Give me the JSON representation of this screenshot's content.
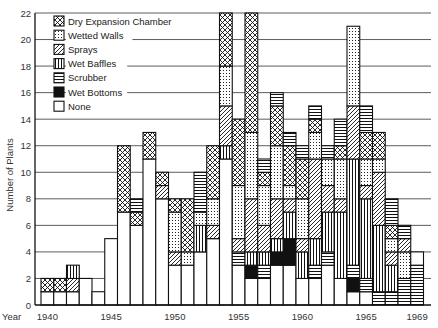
{
  "chart_data": {
    "type": "bar",
    "stacked": true,
    "title": "",
    "xlabel": "Year",
    "ylabel": "Number of Plants",
    "ylim": [
      0,
      22
    ],
    "yticks": [
      0,
      2,
      4,
      6,
      8,
      10,
      12,
      14,
      16,
      18,
      20,
      22
    ],
    "x_tick_labels": [
      {
        "year": 1940,
        "label": "1940"
      },
      {
        "year": 1945,
        "label": "1945"
      },
      {
        "year": 1950,
        "label": "1950"
      },
      {
        "year": 1955,
        "label": "1955"
      },
      {
        "year": 1960,
        "label": "1960"
      },
      {
        "year": 1965,
        "label": "1965"
      },
      {
        "year": 1969,
        "label": "1969"
      }
    ],
    "grid": true,
    "legend_position": "top-left",
    "legend": [
      {
        "key": "dry",
        "label": "Dry Expansion Chamber",
        "pattern": "crosshatch-circles"
      },
      {
        "key": "wetted",
        "label": "Wetted Walls",
        "pattern": "dots"
      },
      {
        "key": "sprays",
        "label": "Sprays",
        "pattern": "diagonal"
      },
      {
        "key": "baffles",
        "label": "Wet Baffles",
        "pattern": "vertical"
      },
      {
        "key": "scrubber",
        "label": "Scrubber",
        "pattern": "horizontal"
      },
      {
        "key": "bottoms",
        "label": "Wet Bottoms",
        "pattern": "solid"
      },
      {
        "key": "none",
        "label": "None",
        "pattern": "empty"
      }
    ],
    "bars": [
      {
        "year": 1940,
        "segments": [
          [
            "none",
            1
          ],
          [
            "dry",
            1
          ]
        ]
      },
      {
        "year": 1941,
        "segments": [
          [
            "none",
            1
          ],
          [
            "dry",
            1
          ]
        ]
      },
      {
        "year": 1942,
        "segments": [
          [
            "none",
            1
          ],
          [
            "sprays",
            1
          ],
          [
            "baffles",
            1
          ]
        ]
      },
      {
        "year": 1943,
        "segments": [
          [
            "none",
            2
          ]
        ]
      },
      {
        "year": 1944,
        "segments": [
          [
            "none",
            1
          ]
        ]
      },
      {
        "year": 1945,
        "segments": [
          [
            "none",
            5
          ]
        ]
      },
      {
        "year": 1946,
        "segments": [
          [
            "none",
            7
          ],
          [
            "dry",
            5
          ]
        ]
      },
      {
        "year": 1947,
        "segments": [
          [
            "none",
            6
          ],
          [
            "dry",
            1
          ],
          [
            "scrubber",
            1
          ]
        ]
      },
      {
        "year": 1948,
        "segments": [
          [
            "none",
            11
          ],
          [
            "dry",
            2
          ]
        ]
      },
      {
        "year": 1949,
        "segments": [
          [
            "none",
            8
          ],
          [
            "sprays",
            1
          ],
          [
            "dry",
            1
          ]
        ]
      },
      {
        "year": 1950,
        "segments": [
          [
            "none",
            3
          ],
          [
            "sprays",
            1
          ],
          [
            "wetted",
            3
          ],
          [
            "dry",
            1
          ]
        ]
      },
      {
        "year": 1951,
        "segments": [
          [
            "none",
            3
          ],
          [
            "wetted",
            1
          ],
          [
            "dry",
            4
          ]
        ]
      },
      {
        "year": 1952,
        "segments": [
          [
            "none",
            4
          ],
          [
            "baffles",
            2
          ],
          [
            "wetted",
            1
          ],
          [
            "scrubber",
            3
          ]
        ]
      },
      {
        "year": 1953,
        "segments": [
          [
            "none",
            5
          ],
          [
            "sprays",
            1
          ],
          [
            "wetted",
            2
          ],
          [
            "dry",
            4
          ]
        ]
      },
      {
        "year": 1954,
        "segments": [
          [
            "none",
            11
          ],
          [
            "baffles",
            1
          ],
          [
            "sprays",
            3
          ],
          [
            "wetted",
            3
          ],
          [
            "dry",
            4
          ]
        ]
      },
      {
        "year": 1955,
        "segments": [
          [
            "none",
            3
          ],
          [
            "scrubber",
            1
          ],
          [
            "sprays",
            1
          ],
          [
            "wetted",
            4
          ],
          [
            "dry",
            5
          ]
        ]
      },
      {
        "year": 1956,
        "segments": [
          [
            "none",
            2
          ],
          [
            "bottoms",
            1
          ],
          [
            "baffles",
            1
          ],
          [
            "sprays",
            4
          ],
          [
            "wetted",
            5
          ],
          [
            "dry",
            9
          ]
        ]
      },
      {
        "year": 1957,
        "segments": [
          [
            "none",
            2
          ],
          [
            "scrubber",
            1
          ],
          [
            "baffles",
            1
          ],
          [
            "sprays",
            2
          ],
          [
            "wetted",
            3
          ],
          [
            "dry",
            1
          ],
          [
            "scrubber",
            1
          ]
        ]
      },
      {
        "year": 1958,
        "segments": [
          [
            "none",
            3
          ],
          [
            "bottoms",
            1
          ],
          [
            "baffles",
            1
          ],
          [
            "sprays",
            3
          ],
          [
            "wetted",
            4
          ],
          [
            "dry",
            3
          ],
          [
            "scrubber",
            1
          ]
        ]
      },
      {
        "year": 1959,
        "segments": [
          [
            "none",
            3
          ],
          [
            "bottoms",
            2
          ],
          [
            "baffles",
            2
          ],
          [
            "sprays",
            1
          ],
          [
            "wetted",
            1
          ],
          [
            "dry",
            3
          ],
          [
            "scrubber",
            1
          ]
        ]
      },
      {
        "year": 1960,
        "segments": [
          [
            "none",
            2
          ],
          [
            "baffles",
            2
          ],
          [
            "sprays",
            1
          ],
          [
            "wetted",
            3
          ],
          [
            "dry",
            3
          ],
          [
            "scrubber",
            1
          ]
        ]
      },
      {
        "year": 1961,
        "segments": [
          [
            "none",
            2
          ],
          [
            "scrubber",
            1
          ],
          [
            "baffles",
            2
          ],
          [
            "sprays",
            6
          ],
          [
            "wetted",
            2
          ],
          [
            "dry",
            1
          ],
          [
            "scrubber",
            1
          ]
        ]
      },
      {
        "year": 1962,
        "segments": [
          [
            "none",
            3
          ],
          [
            "scrubber",
            1
          ],
          [
            "baffles",
            3
          ],
          [
            "sprays",
            2
          ],
          [
            "wetted",
            2
          ],
          [
            "scrubber",
            1
          ]
        ]
      },
      {
        "year": 1963,
        "segments": [
          [
            "none",
            2
          ],
          [
            "baffles",
            5
          ],
          [
            "sprays",
            1
          ],
          [
            "wetted",
            3
          ],
          [
            "dry",
            1
          ],
          [
            "scrubber",
            2
          ]
        ]
      },
      {
        "year": 1964,
        "segments": [
          [
            "none",
            1
          ],
          [
            "bottoms",
            1
          ],
          [
            "scrubber",
            1
          ],
          [
            "baffles",
            8
          ],
          [
            "sprays",
            4
          ],
          [
            "wetted",
            6
          ]
        ]
      },
      {
        "year": 1965,
        "segments": [
          [
            "none",
            1
          ],
          [
            "scrubber",
            1
          ],
          [
            "baffles",
            6
          ],
          [
            "sprays",
            1
          ],
          [
            "wetted",
            2
          ],
          [
            "dry",
            2
          ],
          [
            "scrubber",
            2
          ]
        ]
      },
      {
        "year": 1966,
        "segments": [
          [
            "scrubber",
            1
          ],
          [
            "baffles",
            5
          ],
          [
            "sprays",
            4
          ],
          [
            "wetted",
            1
          ],
          [
            "dry",
            2
          ]
        ]
      },
      {
        "year": 1967,
        "segments": [
          [
            "scrubber",
            1
          ],
          [
            "baffles",
            2
          ],
          [
            "sprays",
            1
          ],
          [
            "wetted",
            1
          ],
          [
            "dry",
            1
          ],
          [
            "scrubber",
            2
          ]
        ]
      },
      {
        "year": 1968,
        "segments": [
          [
            "scrubber",
            2
          ],
          [
            "wetted",
            2
          ],
          [
            "sprays",
            1
          ],
          [
            "scrubber",
            1
          ]
        ]
      },
      {
        "year": 1969,
        "segments": [
          [
            "scrubber",
            3
          ],
          [
            "none",
            1
          ]
        ]
      }
    ]
  }
}
